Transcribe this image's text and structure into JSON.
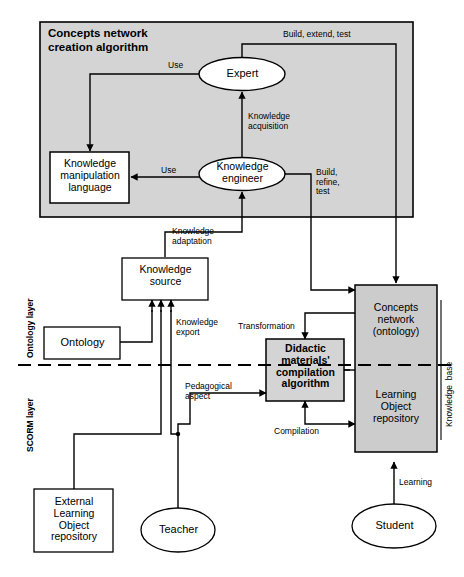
{
  "diagram": {
    "title": "Concepts network creation algorithm",
    "layers": {
      "upper": "Ontology layer",
      "lower": "SCORM layer",
      "knowledge_base": "Knowledge  base"
    },
    "nodes": {
      "algorithm_group": "Concepts network\ncreation algorithm",
      "expert": "Expert",
      "knowledge_engineer": "Knowledge\nengineer",
      "kml": "Knowledge\nmanipulation\nlanguage",
      "knowledge_source": "Knowledge\nsource",
      "ontology": "Ontology",
      "didactic": "Didactic\nmaterials'\ncompilation\nalgorithm",
      "concepts_network": "Concepts\nnetwork\n(ontology)",
      "lo_repository": "Learning\nObject\nrepository",
      "external_lo_repository": "External\nLearning\nObject\nrepository",
      "teacher": "Teacher",
      "student": "Student"
    },
    "edges": {
      "build_extend_test": "Build, extend, test",
      "use_expert": "Use",
      "use_engineer": "Use",
      "knowledge_acquisition": "Knowledge\nacquisition",
      "build_refine_test": "Build,\nrefine,\ntest",
      "knowledge_adaptation": "Knowledge\nadaptation",
      "knowledge_export": "Knowledge\nexport",
      "transformation": "Transformation",
      "pedagogical_aspect": "Pedagogical\naspect",
      "compilation": "Compilation",
      "learning": "Learning"
    },
    "colors": {
      "group_fill": "#d4d4d4",
      "node_fill": "#cccccc",
      "stroke": "#000000",
      "background": "#ffffff"
    }
  }
}
